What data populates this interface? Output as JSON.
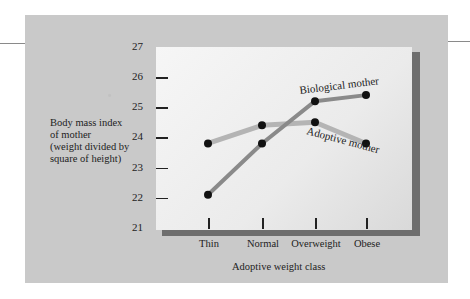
{
  "chart_data": {
    "type": "line",
    "title": "",
    "xlabel": "Adoptive weight class",
    "ylabel": "Body mass index of mother (weight divided by square of height)",
    "ylabel_lines": [
      "Body mass index",
      "of mother",
      "(weight divided by",
      "square of height)"
    ],
    "categories": [
      "Thin",
      "Normal",
      "Overweight",
      "Obese"
    ],
    "yticks": [
      21,
      22,
      23,
      24,
      25,
      26,
      27
    ],
    "ylim": [
      21,
      27
    ],
    "grid": false,
    "legend": "inline labels",
    "series": [
      {
        "name": "Biological mother",
        "values": [
          22.1,
          23.8,
          25.2,
          25.4
        ],
        "color": "#8a8a8a"
      },
      {
        "name": "Adoptive mother",
        "values": [
          23.8,
          24.4,
          24.5,
          23.8
        ],
        "color": "#b4b4b4"
      }
    ]
  },
  "colors": {
    "panel": "#c9c9c9",
    "plot_area": "#efefef",
    "shadow": "#6e6e6e",
    "marker": "#111111"
  }
}
